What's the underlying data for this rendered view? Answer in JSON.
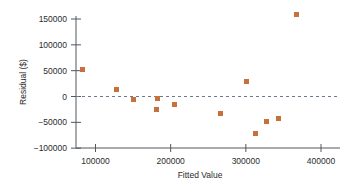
{
  "chart_data": {
    "type": "scatter",
    "title": "",
    "xlabel": "Fitted Value",
    "ylabel": "Residual ($)",
    "xlim": [
      60000,
      420000
    ],
    "ylim": [
      -110000,
      168000
    ],
    "xticks": [
      100000,
      200000,
      300000,
      400000
    ],
    "xticklabels": [
      "100000",
      "200000",
      "300000",
      "400000"
    ],
    "yticks": [
      -100000,
      -50000,
      0,
      50000,
      100000,
      150000
    ],
    "yticklabels": [
      "-100000",
      "-50000",
      "0",
      "50000",
      "100000",
      "150000"
    ],
    "grid": false,
    "legend": null,
    "reference_line": {
      "axis": "y",
      "value": 0,
      "style": "dashed",
      "color": "#6b7a8f"
    },
    "marker_color": "#c8703c",
    "marker_shape": "square",
    "points": [
      {
        "x": 83000,
        "y": 52000
      },
      {
        "x": 128000,
        "y": 13000
      },
      {
        "x": 151000,
        "y": -5000
      },
      {
        "x": 183000,
        "y": -4000
      },
      {
        "x": 181000,
        "y": -26000
      },
      {
        "x": 205000,
        "y": -16000
      },
      {
        "x": 266000,
        "y": -32000
      },
      {
        "x": 301000,
        "y": 29000
      },
      {
        "x": 313000,
        "y": -71000
      },
      {
        "x": 328000,
        "y": -48000
      },
      {
        "x": 343000,
        "y": -42000
      },
      {
        "x": 368000,
        "y": 158000
      }
    ]
  },
  "axes": {
    "x_title": "Fitted Value",
    "y_title": "Residual ($)"
  }
}
